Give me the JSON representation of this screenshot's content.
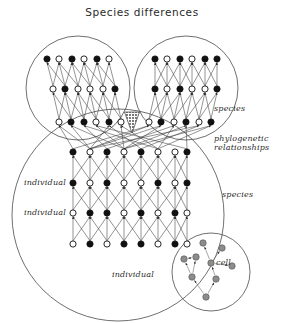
{
  "title": "Species differences",
  "labels": {
    "species_top": "species",
    "phylo": "phylogenetic\nrelationships",
    "species_bottom": "species",
    "individual_1": "individual",
    "individual_2": "individual",
    "individual_3": "individual",
    "cell": "cell"
  },
  "colors": {
    "stroke": "#3a3a3a",
    "node_filled": "#111111",
    "node_open_fill": "#ffffff",
    "cell_node": "#8c8c8c",
    "triangle": "#4a4a4a",
    "background": "#ffffff"
  },
  "chart_data": {
    "type": "diagram",
    "title": "Species differences",
    "enclosures": [
      {
        "name": "species-circle-left",
        "cx": 78,
        "cy": 88,
        "r": 52
      },
      {
        "name": "species-circle-right",
        "cx": 186,
        "cy": 88,
        "r": 52
      },
      {
        "name": "species-circle-lower",
        "cx": 118,
        "cy": 215,
        "r": 106
      },
      {
        "name": "cell-circle-inset",
        "cx": 211,
        "cy": 272,
        "r": 39
      }
    ],
    "marker": {
      "name": "divergence-triangle",
      "x": 132,
      "y": 115,
      "w": 15,
      "h": 20,
      "shape": "down-triangle-hatched"
    },
    "node_states": [
      "filled",
      "open"
    ],
    "rows": [
      {
        "group": "left-species",
        "y": 59,
        "xs": [
          47,
          59,
          72,
          84,
          97,
          109
        ],
        "states": [
          "filled",
          "open",
          "filled",
          "open",
          "filled",
          "open"
        ]
      },
      {
        "group": "left-species",
        "y": 89,
        "xs": [
          53,
          65,
          78,
          90,
          103,
          115
        ],
        "states": [
          "open",
          "filled",
          "open",
          "open",
          "open",
          "filled"
        ]
      },
      {
        "group": "left-species",
        "y": 122,
        "xs": [
          59,
          71,
          84,
          96,
          109,
          121
        ],
        "states": [
          "open",
          "filled",
          "filled",
          "open",
          "filled",
          "open"
        ]
      },
      {
        "group": "right-species",
        "y": 59,
        "xs": [
          155,
          167,
          180,
          192,
          205,
          217
        ],
        "states": [
          "filled",
          "open",
          "filled",
          "open",
          "filled",
          "filled"
        ]
      },
      {
        "group": "right-species",
        "y": 89,
        "xs": [
          155,
          167,
          180,
          192,
          205,
          217
        ],
        "states": [
          "filled",
          "open",
          "filled",
          "open",
          "open",
          "filled"
        ]
      },
      {
        "group": "right-species",
        "y": 122,
        "xs": [
          149,
          161,
          174,
          186,
          199,
          211
        ],
        "states": [
          "open",
          "filled",
          "open",
          "filled",
          "open",
          "filled"
        ]
      },
      {
        "group": "lower-species",
        "y": 152,
        "xs": [
          73,
          90,
          107,
          124,
          141,
          158,
          175,
          187
        ],
        "states": [
          "filled",
          "open",
          "filled",
          "open",
          "filled",
          "open",
          "open",
          "filled"
        ]
      },
      {
        "group": "lower-species",
        "y": 183,
        "xs": [
          73,
          90,
          107,
          124,
          141,
          158,
          175,
          187
        ],
        "states": [
          "filled",
          "open",
          "filled",
          "open",
          "open",
          "filled",
          "open",
          "filled"
        ]
      },
      {
        "group": "lower-species",
        "y": 213,
        "xs": [
          73,
          90,
          107,
          124,
          141,
          158,
          175,
          187
        ],
        "states": [
          "open",
          "filled",
          "filled",
          "open",
          "filled",
          "open",
          "filled",
          "open"
        ]
      },
      {
        "group": "lower-species",
        "y": 244,
        "xs": [
          73,
          90,
          107,
          124,
          141,
          158,
          175,
          187
        ],
        "states": [
          "open",
          "filled",
          "open",
          "filled",
          "filled",
          "open",
          "filled",
          "open"
        ]
      }
    ],
    "cell_nodes": [
      {
        "x": 203,
        "y": 243
      },
      {
        "x": 222,
        "y": 248
      },
      {
        "x": 184,
        "y": 259
      },
      {
        "x": 196,
        "y": 257
      },
      {
        "x": 211,
        "y": 263
      },
      {
        "x": 232,
        "y": 266
      },
      {
        "x": 192,
        "y": 277
      },
      {
        "x": 216,
        "y": 279
      },
      {
        "x": 206,
        "y": 297
      }
    ]
  }
}
